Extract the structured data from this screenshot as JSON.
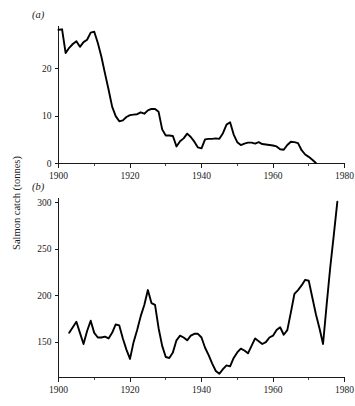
{
  "figure": {
    "ylabel": "Salmon catch (tonnes)",
    "panel_a_label": "(a)",
    "panel_b_label": "(b)"
  },
  "chart_data": [
    {
      "type": "line",
      "panel": "(a)",
      "title": "",
      "xlabel": "",
      "ylabel": "Salmon catch (tonnes)",
      "xlim": [
        1900,
        1980
      ],
      "ylim": [
        0,
        29
      ],
      "grid": false,
      "legend": "none",
      "xticks": [
        1900,
        1920,
        1940,
        1960,
        1980
      ],
      "xtick_labels": [
        "1900",
        "1920",
        "1940",
        "1960",
        "1980"
      ],
      "yticks": [
        0,
        10,
        20
      ],
      "ytick_labels": [
        "0",
        "10",
        "20"
      ],
      "x": [
        1900,
        1901,
        1902,
        1903,
        1904,
        1905,
        1906,
        1907,
        1908,
        1909,
        1910,
        1911,
        1912,
        1913,
        1914,
        1915,
        1916,
        1917,
        1918,
        1919,
        1920,
        1921,
        1922,
        1923,
        1924,
        1925,
        1926,
        1927,
        1928,
        1929,
        1930,
        1931,
        1932,
        1933,
        1934,
        1935,
        1936,
        1937,
        1938,
        1939,
        1940,
        1941,
        1942,
        1943,
        1944,
        1945,
        1946,
        1947,
        1948,
        1949,
        1950,
        1951,
        1952,
        1953,
        1954,
        1955,
        1956,
        1957,
        1958,
        1959,
        1960,
        1961,
        1962,
        1963,
        1964,
        1965,
        1966,
        1967,
        1968,
        1969,
        1970,
        1971,
        1972
      ],
      "values": [
        28.2,
        28.3,
        23.3,
        24.4,
        25.2,
        25.8,
        24.6,
        25.6,
        26.1,
        27.6,
        27.8,
        25.4,
        22.5,
        19.0,
        15.6,
        12.0,
        10.0,
        8.9,
        9.1,
        9.8,
        10.2,
        10.3,
        10.4,
        10.8,
        10.5,
        11.2,
        11.5,
        11.5,
        10.9,
        7.2,
        5.9,
        5.9,
        5.8,
        3.6,
        4.7,
        5.3,
        6.3,
        5.6,
        4.6,
        3.4,
        3.2,
        5.1,
        5.2,
        5.2,
        5.3,
        5.2,
        6.4,
        8.2,
        8.7,
        6.1,
        4.5,
        3.9,
        4.2,
        4.4,
        4.4,
        4.2,
        4.5,
        4.1,
        4.0,
        3.9,
        3.8,
        3.6,
        3.0,
        2.9,
        3.9,
        4.6,
        4.5,
        4.3,
        2.8,
        1.9,
        1.4,
        0.8,
        0.1
      ]
    },
    {
      "type": "line",
      "panel": "(b)",
      "title": "",
      "xlabel": "",
      "ylabel": "Salmon catch (tonnes)",
      "xlim": [
        1900,
        1980
      ],
      "ylim": [
        112,
        305
      ],
      "grid": false,
      "legend": "none",
      "xticks": [
        1900,
        1920,
        1940,
        1960,
        1980
      ],
      "xtick_labels": [
        "1900",
        "1920",
        "1940",
        "1960",
        "1980"
      ],
      "yticks": [
        150,
        200,
        250,
        300
      ],
      "ytick_labels": [
        "150",
        "200",
        "250",
        "300"
      ],
      "x": [
        1903,
        1904,
        1905,
        1906,
        1907,
        1908,
        1909,
        1910,
        1911,
        1912,
        1913,
        1914,
        1915,
        1916,
        1917,
        1918,
        1919,
        1920,
        1921,
        1922,
        1923,
        1924,
        1925,
        1926,
        1927,
        1928,
        1929,
        1930,
        1931,
        1932,
        1933,
        1934,
        1935,
        1936,
        1937,
        1938,
        1939,
        1940,
        1941,
        1942,
        1943,
        1944,
        1945,
        1946,
        1947,
        1948,
        1949,
        1950,
        1951,
        1952,
        1953,
        1954,
        1955,
        1956,
        1957,
        1958,
        1959,
        1960,
        1961,
        1962,
        1963,
        1964,
        1965,
        1966,
        1967,
        1968,
        1969,
        1970,
        1971,
        1972,
        1973,
        1974,
        1975,
        1976,
        1977,
        1978
      ],
      "values": [
        160,
        166,
        172,
        160,
        148,
        162,
        173,
        160,
        155,
        155,
        156,
        154,
        160,
        169,
        168,
        154,
        142,
        132,
        150,
        163,
        178,
        190,
        206,
        192,
        190,
        165,
        146,
        134,
        133,
        139,
        152,
        157,
        155,
        152,
        157,
        159,
        159,
        155,
        144,
        136,
        127,
        119,
        116,
        121,
        125,
        124,
        133,
        139,
        143,
        141,
        138,
        146,
        154,
        151,
        148,
        150,
        155,
        157,
        163,
        166,
        158,
        163,
        182,
        202,
        206,
        211,
        217,
        216,
        198,
        180,
        165,
        148,
        190,
        230,
        265,
        301
      ]
    }
  ]
}
